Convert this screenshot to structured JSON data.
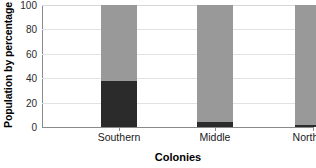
{
  "chart_data": {
    "type": "bar",
    "title": "",
    "subtitle": "",
    "xlabel": "Colonies",
    "ylabel": "Population by percentage",
    "categories": [
      "Southern",
      "Middle",
      "Northern"
    ],
    "series": [
      {
        "name": "lower-segment",
        "color": "#2b2b2b",
        "values": [
          38,
          4,
          2
        ]
      },
      {
        "name": "upper-segment",
        "color": "#999999",
        "values": [
          62,
          96,
          98
        ]
      }
    ],
    "stacked": true,
    "ylim": [
      0,
      100
    ],
    "yticks": [
      0,
      20,
      40,
      60,
      80,
      100
    ],
    "ytick_labels": [
      "0",
      "20",
      "40",
      "60",
      "80",
      "100"
    ],
    "grid": true,
    "legend": "none",
    "annotations": []
  },
  "axes": {
    "y_title": "Population by percentage",
    "x_title": "Colonies"
  },
  "colors": {
    "lower": "#2b2b2b",
    "upper": "#999999",
    "grid": "#e2e2e2",
    "axis": "#8a8a8a",
    "background": "#ffffff"
  },
  "watermark": {
    "text": ""
  }
}
